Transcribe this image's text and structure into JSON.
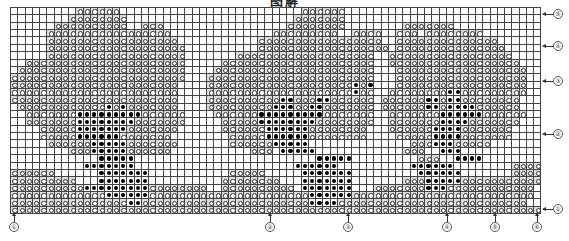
{
  "title": "图解",
  "legend": {
    "empty": "blank cell",
    "o": "ring stitch (light)",
    "x": "filled dot stitch (dark)"
  },
  "grid": {
    "cols": 73,
    "rows": 28,
    "pattern": [
      ".........oooooo.........................oooooo..........................",
      "........oooooooo.......................ooooooo..........................",
      "......oooooooooo..ooo.................oooooooo........ooooooo..........",
      ".....ooooooooooooooooo..............ooooooooo..oooo..ooo.oooooooo.......",
      ".....oooooooooooooooooo...........ooooooooooooooooo..oooooooooooooo.....",
      ".....ooooooooooooooooooo..........oooooooooooooooooo.ooooooooooooooo....",
      ".....ooooooooooooooooooo.......ooooooooooooooooooo..ooooooooooooooooo...",
      "..oooooooooooooooooooooo.....ooooooooooooooooooooo..oooooooooooooooooo..",
      ".ooooooooooooooooooooooo....oooooooooooooooooooooo...oooooooooooooooooo.",
      "oooooooooooooooooooooooo...ooooooooooooooooooooooo...oooooooooooooooooo.",
      "ooooooooooooooooooooooo....ooooooooooooooooooooxox...oooooooooooooooooo.",
      "ooooooooooooooooooooooo....ooooooooooooooooooooxoo..ooooooooxxooooooooo.",
      "ooooooooooooooooooooooo....ooooooooooxxoooxxoooooo.ooooooxxoxxoooooooo..",
      ".ooooooooooooxoxooooooo....oooooooooxxxooxxooooooo.ooooooxxoxxxxoooooo..",
      "..oooooooxxxxxxxxxoooooo....ooooooxxxxxxxxxooooooo..oooooooxxxxxxoooooo.",
      "..oooooooxxxxxxxxooooooo.....oooooxxxxxxxxoooooooo..oooooooxxxxooooooo..",
      "....oooooxxxxxxxooooooo......ooooooxxxxxxoooooooo...ooooooxxxxooooooo...",
      "....oooooxxxxxxooooooo........oooooxxxxxxoooooooo....oooooxxxxooooooo...",
      ".....ooooooxxxxxooooooo.......ooooooxxxxx..............oooxxxooooo......",
      "........oooxxxxxoooooo...........ooo.xxxxx............ooo..xxx..........",
      "............xxxxx.........................xxxxx.........ooo..xxxx.........",
      "..........xxxxxxx......................xxxxxx..........xxxxxx........oooo",
      "oooooo......xxxxxxx...........ooooo.....xxxxxxx.........xxxxxx.......oooo",
      "ooooooooo...xxxxxxx..........oooooooo...xxxxxxx.......oooxxxxxooooooooooo",
      "ooooooooooxxxxxxxxxoooooooo..oooooooooo.xxxxxxx...oooooooxxxoooooooooooo",
      "oooooooooooooxxxxxxooooooooooooooooooooooxxxxxxooooooooooooooooooooooooo",
      "ooooooooooooooooxxoooooooooooooooooooooooxxxxoooooooooooooooooooooooooo",
      "ooooooooooooooooooooooooooooooooooooooooooooooooooooooooooooooooooooooooo"
    ]
  },
  "right_markers": [
    {
      "label": "⑤",
      "top": 9
    },
    {
      "label": "④",
      "top": 41
    },
    {
      "label": "③",
      "top": 76
    },
    {
      "label": "②",
      "top": 129
    },
    {
      "label": "①",
      "top": 204
    }
  ],
  "bottom_markers": [
    {
      "label": "①",
      "left": 9
    },
    {
      "label": "②",
      "left": 265
    },
    {
      "label": "③",
      "left": 343
    },
    {
      "label": "④",
      "left": 442
    },
    {
      "label": "⑤",
      "left": 490
    },
    {
      "label": "⑥",
      "left": 532
    }
  ]
}
